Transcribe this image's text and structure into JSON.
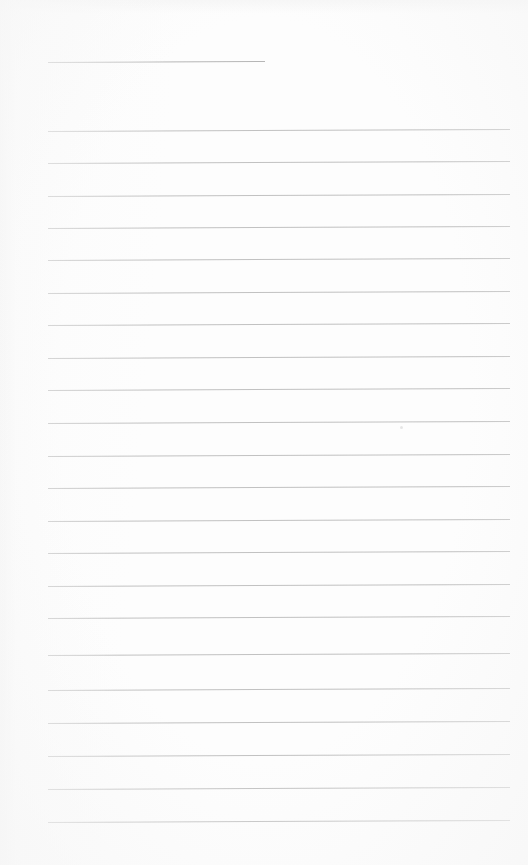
{
  "document": {
    "kind": "scanned-blank-ruled-notebook-page",
    "page_width": 528,
    "page_height": 865,
    "background_color": "#fdfdfd",
    "rule_color": "#bcbcbc",
    "header_rule_color": "#b0b0b0",
    "text_content": "",
    "has_handwriting": false,
    "has_printed_text": false
  },
  "layout": {
    "left_margin_x": 48,
    "right_margin_x": 510,
    "rule_spacing_px": 32.4,
    "first_rule_y": 62,
    "last_rule_y": 822,
    "bottom_margin_px": 43,
    "scan_skew_deg": -0.25
  },
  "header_rule": {
    "name": "title-rule",
    "x": 48,
    "y": 62,
    "width": 217
  },
  "rules": [
    {
      "y": 131,
      "x": 48,
      "width": 462
    },
    {
      "y": 163,
      "x": 48,
      "width": 462
    },
    {
      "y": 196,
      "x": 48,
      "width": 462
    },
    {
      "y": 228,
      "x": 48,
      "width": 462
    },
    {
      "y": 260,
      "x": 48,
      "width": 462
    },
    {
      "y": 293,
      "x": 48,
      "width": 462
    },
    {
      "y": 325,
      "x": 48,
      "width": 462
    },
    {
      "y": 358,
      "x": 48,
      "width": 462
    },
    {
      "y": 390,
      "x": 48,
      "width": 462
    },
    {
      "y": 423,
      "x": 48,
      "width": 462
    },
    {
      "y": 456,
      "x": 48,
      "width": 462
    },
    {
      "y": 488,
      "x": 48,
      "width": 462
    },
    {
      "y": 521,
      "x": 48,
      "width": 462
    },
    {
      "y": 553,
      "x": 48,
      "width": 462
    },
    {
      "y": 586,
      "x": 48,
      "width": 462
    },
    {
      "y": 618,
      "x": 48,
      "width": 462
    },
    {
      "y": 655,
      "x": 48,
      "width": 462
    },
    {
      "y": 690,
      "x": 48,
      "width": 462
    },
    {
      "y": 723,
      "x": 48,
      "width": 462
    },
    {
      "y": 756,
      "x": 48,
      "width": 462
    },
    {
      "y": 789,
      "x": 48,
      "width": 462
    },
    {
      "y": 822,
      "x": 48,
      "width": 462
    }
  ],
  "artifacts": [
    {
      "name": "scan-speck",
      "x": 400,
      "y": 426,
      "size": 3
    }
  ]
}
